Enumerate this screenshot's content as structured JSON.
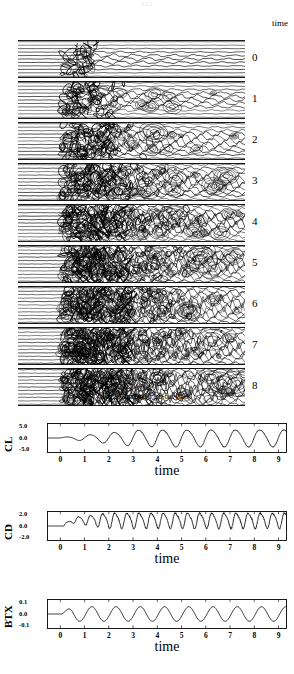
{
  "page": {
    "page_number": "312"
  },
  "figure": {
    "time_header": "time",
    "caption_prefix": "Fig.3",
    "caption_text": "Computed iso-bar lines.",
    "panels": [
      {
        "label": "0",
        "turbulence": 0.08,
        "seed": 11
      },
      {
        "label": "1",
        "turbulence": 0.3,
        "seed": 23
      },
      {
        "label": "2",
        "turbulence": 0.52,
        "seed": 37
      },
      {
        "label": "3",
        "turbulence": 0.68,
        "seed": 53
      },
      {
        "label": "4",
        "turbulence": 0.8,
        "seed": 71
      },
      {
        "label": "5",
        "turbulence": 0.88,
        "seed": 89
      },
      {
        "label": "6",
        "turbulence": 0.93,
        "seed": 101
      },
      {
        "label": "7",
        "turbulence": 0.97,
        "seed": 113
      },
      {
        "label": "8",
        "turbulence": 1.0,
        "seed": 131
      }
    ]
  },
  "chart_data": [
    {
      "type": "line",
      "name": "CL",
      "ylabel": "CL",
      "xlabel": "time",
      "yticks": [
        "5.0",
        "0.0",
        "-5.0"
      ],
      "ylim": [
        -5.0,
        5.0
      ],
      "xticks": [
        "0",
        "1",
        "2",
        "3",
        "4",
        "5",
        "6",
        "7",
        "8",
        "9"
      ],
      "xlim": [
        -0.55,
        9.35
      ],
      "grid": false,
      "legend": "none",
      "waveform": {
        "start_time": 0.0,
        "flat_before_start": true,
        "period": 1.0,
        "phase": 0.0,
        "mean": 0.0,
        "growth_start_time": 0.15,
        "growth_end_time": 3.3,
        "initial_amplitude": 0.3,
        "final_amplitude": 3.0,
        "harmonic2_ratio": 0.1,
        "noise": 0.04
      }
    },
    {
      "type": "line",
      "name": "CD",
      "ylabel": "CD",
      "xlabel": "time",
      "yticks": [
        "2.0",
        "0.0",
        "-2.0"
      ],
      "ylim": [
        -2.0,
        2.0
      ],
      "xticks": [
        "0",
        "1",
        "2",
        "3",
        "4",
        "5",
        "6",
        "7",
        "8",
        "9"
      ],
      "xlim": [
        -0.55,
        9.35
      ],
      "grid": false,
      "legend": "none",
      "waveform": {
        "start_time": 0.15,
        "flat_before_start": true,
        "period": 0.5,
        "phase": 0.0,
        "mean": 0.85,
        "growth_start_time": 0.2,
        "growth_end_time": 2.0,
        "initial_amplitude": 0.25,
        "final_amplitude": 1.05,
        "harmonic2_ratio": 0.22,
        "noise": 0.1
      }
    },
    {
      "type": "line",
      "name": "BTX",
      "ylabel": "BTX",
      "xlabel": "time",
      "yticks": [
        "0.1",
        "0.0",
        "-0.1"
      ],
      "ylim": [
        -0.1,
        0.1
      ],
      "xticks": [
        "0",
        "1",
        "2",
        "3",
        "4",
        "5",
        "6",
        "7",
        "8",
        "9"
      ],
      "xlim": [
        -0.55,
        9.35
      ],
      "grid": false,
      "legend": "none",
      "waveform": {
        "start_time": 0.05,
        "flat_before_start": true,
        "period": 1.0,
        "phase": 0.0,
        "mean": 0.0,
        "growth_start_time": 0.05,
        "growth_end_time": 0.5,
        "initial_amplitude": 0.01,
        "final_amplitude": 0.052,
        "harmonic2_ratio": 0.0,
        "noise": 0.0
      }
    }
  ],
  "layout": {
    "plot_tops": [
      421,
      509,
      597
    ],
    "frame_top_offset": 2,
    "frame_height": 30,
    "frame_left": 47,
    "frame_width": 240,
    "panel_left": 18,
    "panel_width": 227,
    "panel_height": 38,
    "panel_gap": 3,
    "panel_top": 22,
    "label_color": "#000000"
  }
}
